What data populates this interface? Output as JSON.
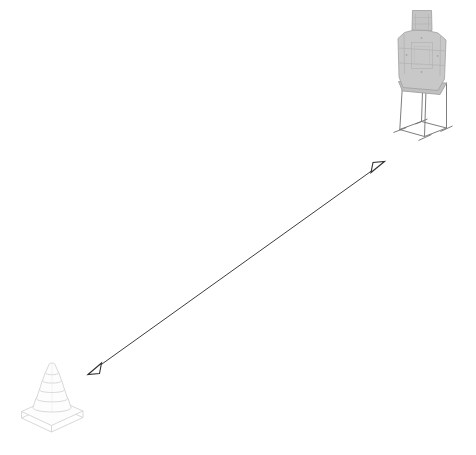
{
  "scene": {
    "title": "Range Layout Diagram",
    "width": 476,
    "height": 455,
    "background_color": "#ffffff",
    "header_fragment": "",
    "description": "Isometric line drawing of a shooting-range layout: a humanoid silhouette target on a wire stand at the upper right, a traffic cone at the lower left, and a double-headed dimension arrow spanning the distance between them."
  },
  "objects": {
    "target": {
      "name": "silhouette target on stand",
      "label": "",
      "fill_color": "#c8c8c8",
      "stroke_color": "#9a9a9a",
      "stand_stroke_color": "#6e6e6e",
      "position": {
        "x": 416,
        "y": 80
      }
    },
    "cone": {
      "name": "traffic cone",
      "label": "",
      "fill_color": "#fdfdfd",
      "stroke_color": "#d7d7d7",
      "position": {
        "x": 52,
        "y": 398
      }
    },
    "dimension_arrow": {
      "name": "distance dimension arrow",
      "label": "",
      "stroke_color": "#3d3d3d",
      "stroke_width": 1,
      "head_style": "open-triangle",
      "double_headed": true,
      "start": {
        "x": 88,
        "y": 374
      },
      "end": {
        "x": 384,
        "y": 162
      }
    }
  }
}
